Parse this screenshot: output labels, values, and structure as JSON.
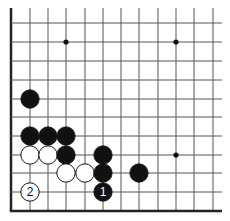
{
  "diagram": {
    "type": "go-board-fragment",
    "grid": {
      "columns_x": [
        11,
        30,
        48,
        66,
        85,
        103,
        121,
        139,
        158,
        176,
        194,
        213
      ],
      "rows_y": [
        23,
        42,
        61,
        80,
        99,
        117,
        136,
        155,
        173,
        192,
        211
      ],
      "top_extent": 8,
      "right_extent": 222,
      "left_edge_thick": true,
      "bottom_edge_thick": true,
      "line_color": "#555555",
      "edge_color": "#222222"
    },
    "star_points": [
      {
        "col": 3,
        "row": 1
      },
      {
        "col": 9,
        "row": 1
      },
      {
        "col": 9,
        "row": 7
      }
    ],
    "stones": [
      {
        "color": "black",
        "col": 1,
        "row": 4,
        "label": ""
      },
      {
        "color": "black",
        "col": 1,
        "row": 6,
        "label": ""
      },
      {
        "color": "black",
        "col": 2,
        "row": 6,
        "label": ""
      },
      {
        "color": "black",
        "col": 3,
        "row": 6,
        "label": ""
      },
      {
        "color": "white",
        "col": 1,
        "row": 7,
        "label": ""
      },
      {
        "color": "white",
        "col": 2,
        "row": 7,
        "label": ""
      },
      {
        "color": "black",
        "col": 3,
        "row": 7,
        "label": ""
      },
      {
        "color": "black",
        "col": 5,
        "row": 7,
        "label": ""
      },
      {
        "color": "white",
        "col": 3,
        "row": 8,
        "label": ""
      },
      {
        "color": "white",
        "col": 4,
        "row": 8,
        "label": ""
      },
      {
        "color": "black",
        "col": 5,
        "row": 8,
        "label": ""
      },
      {
        "color": "black",
        "col": 7,
        "row": 8,
        "label": ""
      },
      {
        "color": "white",
        "col": 1,
        "row": 9,
        "label": "2"
      },
      {
        "color": "black",
        "col": 5,
        "row": 9,
        "label": "1"
      }
    ]
  }
}
